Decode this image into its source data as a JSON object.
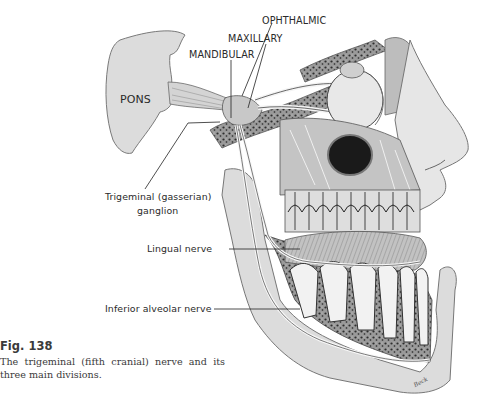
{
  "figure": {
    "number": "Fig. 138",
    "caption": "The trigeminal (fifth cranial) nerve and its three main divisions.",
    "illustration": "trigeminal-nerve-anatomy",
    "artist_signature": "Beck"
  },
  "labels": {
    "ophthalmic": "OPHTHALMIC",
    "maxillary": "MAXILLARY",
    "mandibular": "MANDIBULAR",
    "pons": "PONS",
    "ganglion_line1": "Trigeminal  (gasserian)",
    "ganglion_line2": "ganglion",
    "lingual": "Lingual  nerve",
    "inferior_alveolar": "Inferior  alveolar  nerve"
  },
  "colors": {
    "ink": "#2a2a2a",
    "tissue_light": "#e6e6e6",
    "tissue_mid": "#c9c9c9",
    "bone_dark": "#5a5a5a",
    "background": "#ffffff"
  }
}
